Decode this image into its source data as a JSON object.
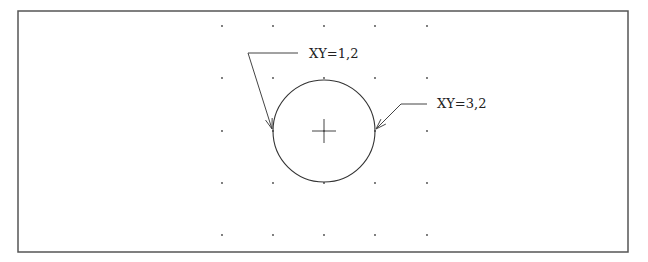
{
  "diagram": {
    "type": "cad-circle-2point",
    "frame": {
      "x": 18,
      "y": 11,
      "width": 610,
      "height": 241,
      "stroke": "#555555"
    },
    "grid": {
      "columns": [
        222,
        273,
        324,
        375,
        427
      ],
      "rows": [
        26,
        78,
        131,
        183,
        235
      ],
      "dot_color": "#444444"
    },
    "circle": {
      "cx": 324,
      "cy": 131,
      "r": 51,
      "stroke": "#333333"
    },
    "center_mark": {
      "size": 12
    },
    "callouts": [
      {
        "text": "XY=1,2",
        "text_x": 309,
        "text_y": 58,
        "leader": [
          [
            298,
            53
          ],
          [
            248,
            53
          ],
          [
            272,
            129
          ]
        ]
      },
      {
        "text": "XY=3,2",
        "text_x": 437,
        "text_y": 108,
        "leader": [
          [
            427,
            104
          ],
          [
            401,
            104
          ],
          [
            376,
            129
          ]
        ]
      }
    ]
  }
}
